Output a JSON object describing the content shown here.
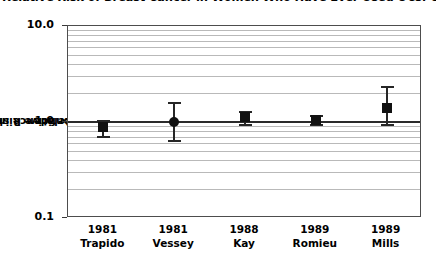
{
  "chart_data": {
    "type": "scatter",
    "title": "Relative Risk of Breast Cancer in Women Who Have Ever Used OCs: Cohort Studies",
    "xlabel": "",
    "ylabel": "Relative Risk (95% confidence interval)",
    "ylabel_lines": [
      "Relative Risk",
      "(95% confidence interval)"
    ],
    "yscale": "log",
    "ylim": [
      0.1,
      10.0
    ],
    "ytick_labels": [
      "10.0",
      "1.0",
      "0.1"
    ],
    "ytick_values": [
      10.0,
      1.0,
      0.1
    ],
    "minor_gridlines": [
      0.2,
      0.3,
      0.4,
      0.5,
      0.6,
      0.7,
      0.8,
      0.9,
      2,
      3,
      4,
      5,
      6,
      7,
      8,
      9
    ],
    "grid": true,
    "legend": "none",
    "reference_line": 1.0,
    "categories": [
      "1981 Trapido",
      "1981 Vessey",
      "1988 Kay",
      "1989 Romieu",
      "1989 Mills"
    ],
    "x_tick_years": [
      "1981",
      "1981",
      "1988",
      "1989",
      "1989"
    ],
    "x_tick_authors": [
      "Trapido",
      "Vessey",
      "Kay",
      "Romieu",
      "Mills"
    ],
    "values": [
      0.88,
      1.0,
      1.12,
      1.05,
      1.4
    ],
    "ci_low": [
      0.72,
      0.65,
      0.95,
      0.95,
      0.95
    ],
    "ci_high": [
      1.05,
      1.6,
      1.3,
      1.18,
      2.35
    ],
    "marker_shapes": [
      "square",
      "circle",
      "square",
      "square",
      "square"
    ],
    "points": [
      {
        "label": "1981 Trapido",
        "year": "1981",
        "author": "Trapido",
        "rr": 0.88,
        "low": 0.72,
        "high": 1.05,
        "shape": "square"
      },
      {
        "label": "1981 Vessey",
        "year": "1981",
        "author": "Vessey",
        "rr": 1.0,
        "low": 0.65,
        "high": 1.6,
        "shape": "circle"
      },
      {
        "label": "1988 Kay",
        "year": "1988",
        "author": "Kay",
        "rr": 1.12,
        "low": 0.95,
        "high": 1.3,
        "shape": "square"
      },
      {
        "label": "1989 Romieu",
        "year": "1989",
        "author": "Romieu",
        "rr": 1.05,
        "low": 0.95,
        "high": 1.18,
        "shape": "square"
      },
      {
        "label": "1989 Mills",
        "year": "1989",
        "author": "Mills",
        "rr": 1.4,
        "low": 0.95,
        "high": 2.35,
        "shape": "square"
      }
    ],
    "colors": {
      "marker": "#111111",
      "whisker": "#262626",
      "reference_line": "#2b2b2b",
      "gridline": "#b9b9b9",
      "frame": "#4d4d4d",
      "text": "#000000",
      "background": "#ffffff"
    }
  }
}
